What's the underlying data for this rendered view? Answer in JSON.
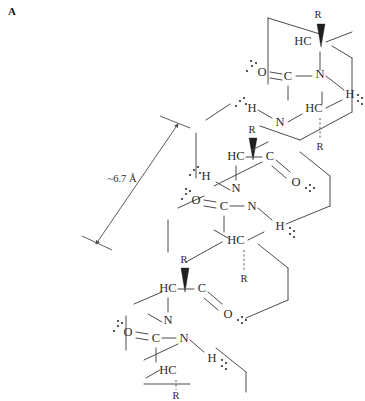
{
  "figure": {
    "panel_label": "A",
    "background_color": "#ffffff",
    "line_color": "#4a4a4a",
    "text_color": "#2b2b2b"
  },
  "dimension": {
    "label": "~6.7 Å",
    "value": 6.7,
    "unit": "Å",
    "meaning": "helix pitch per turn",
    "arrow_style": "double-headed"
  },
  "atoms": {
    "carbon": "C",
    "nitrogen": "N",
    "oxygen": "O",
    "hydrogen": "H",
    "sidechain": "R",
    "alpha_carbon": "HC",
    "amide_hydrogen": "H",
    "carbonyl_carbon": "C",
    "carbonyl_oxygen": "O"
  },
  "residues": [
    {
      "index": 1,
      "position": "top",
      "alpha_carbon": "HC",
      "sidechain": "R",
      "carbonyl_carbon": "C",
      "carbonyl_oxygen": "O",
      "amide_nitrogen": "N",
      "amide_hydrogen": "H"
    },
    {
      "index": 2,
      "position": "upper-middle",
      "alpha_carbon": "HC",
      "sidechain": "R",
      "carbonyl_carbon": "C",
      "carbonyl_oxygen": "O",
      "amide_nitrogen": "N",
      "amide_hydrogen": "H"
    },
    {
      "index": 3,
      "position": "middle",
      "alpha_carbon": "HC",
      "sidechain": "R",
      "carbonyl_carbon": "C",
      "carbonyl_oxygen": "O",
      "amide_nitrogen": "N",
      "amide_hydrogen": "H"
    },
    {
      "index": 4,
      "position": "lower-middle",
      "alpha_carbon": "HC",
      "sidechain": "R",
      "carbonyl_carbon": "C",
      "carbonyl_oxygen": "O",
      "amide_nitrogen": "N",
      "amide_hydrogen": "H"
    },
    {
      "index": 5,
      "position": "bottom",
      "alpha_carbon": "HC",
      "sidechain": "R",
      "carbonyl_carbon": "C",
      "carbonyl_oxygen": "O",
      "amide_nitrogen": "N",
      "amide_hydrogen": "H"
    }
  ],
  "labels": {
    "R_top": "R",
    "HC_top": "HC",
    "O_top": "O",
    "N_top": "N",
    "H_top_right": "H",
    "H_r2_left": "H",
    "HC_r2": "HC",
    "R_r2_below": "R",
    "R_r3_wedge": "R",
    "HC_r3": "HC",
    "C_r3": "C",
    "O_r3": "O",
    "O_r4": "O",
    "C_r4": "C",
    "N_r4": "N",
    "H_r4_right": "H",
    "H_r4_left": "H",
    "HC_r4": "HC",
    "R_r4_below": "R",
    "N_r3": "N",
    "R_r5_wedge": "R",
    "HC_r5": "HC",
    "C_r5": "C",
    "O_r5": "O",
    "O_bottom": "O",
    "C_bottom": "C",
    "N_bottom": "N",
    "H_bottom_right": "H",
    "HC_bottom": "HC",
    "R_bottom": "R",
    "C_r2": "C",
    "N_r2": "N"
  },
  "hydrogen_bonds": {
    "symbol": "dots",
    "description": "dotted lone pairs and N-H...O=C hydrogen bonds",
    "count": 10
  }
}
